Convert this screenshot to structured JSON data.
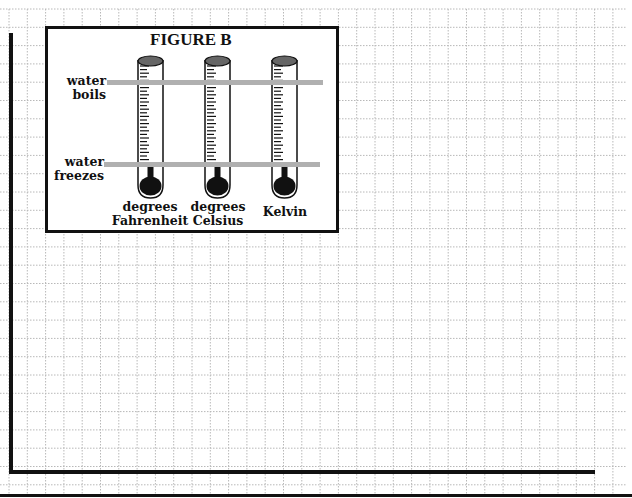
{
  "figure": {
    "title": "FIGURE B",
    "band_labels": {
      "boils_line1": "water",
      "boils_line2": "boils",
      "freezes_line1": "water",
      "freezes_line2": "freezes"
    },
    "thermometers": [
      {
        "label_line1": "degrees",
        "label_line2": "Fahrenheit"
      },
      {
        "label_line1": "degrees",
        "label_line2": "Celsius"
      },
      {
        "label_line1": "",
        "label_line2": "Kelvin"
      }
    ]
  },
  "colors": {
    "grid": "#b8b8b8",
    "axis": "#111111",
    "band": "#b0b0b0",
    "cap": "#666666",
    "bulb": "#111111"
  },
  "graph": {
    "grid_spacing_px": 18.3,
    "x_axis_label": "",
    "y_axis_label": ""
  }
}
